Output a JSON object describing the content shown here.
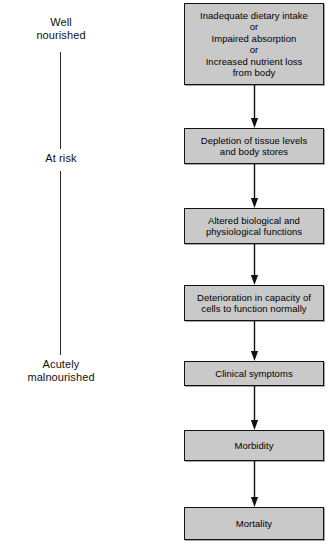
{
  "figure": {
    "background_color": "#ffffff",
    "box_fill_color": "#c9c9c9",
    "box_border_color": "#111111",
    "line_color": "#2a2a2a"
  },
  "severity_axis": {
    "name": "nutritional-status-scale",
    "labels": [
      {
        "id": "well-nourished",
        "text": "Well\nnourished"
      },
      {
        "id": "at-risk",
        "text": "At risk"
      },
      {
        "id": "acutely-malnourished",
        "text": "Acutely\nmalnourished"
      }
    ]
  },
  "flow": {
    "steps": [
      {
        "id": "step-1",
        "text": "Inadequate dietary intake\nor\nImpaired absorption\nor\nIncreased nutrient loss\nfrom body"
      },
      {
        "id": "step-2",
        "text": "Depletion of tissue levels\nand body stores"
      },
      {
        "id": "step-3",
        "text": "Altered biological and\nphysiological functions"
      },
      {
        "id": "step-4",
        "text": "Deterioration in capacity of\ncells to function normally"
      },
      {
        "id": "step-5",
        "text": "Clinical symptoms"
      },
      {
        "id": "step-6",
        "text": "Morbidity"
      },
      {
        "id": "step-7",
        "text": "Mortality"
      }
    ],
    "connector_count": 6
  }
}
